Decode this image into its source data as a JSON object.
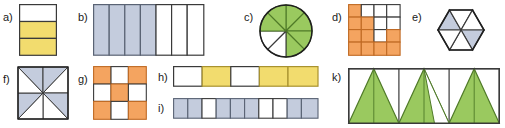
{
  "page": {
    "kind": "worksheet-fraction-shading-figures",
    "background": "#ffffff",
    "width": 505,
    "height": 128
  },
  "colors": {
    "yellow": "#f2dc6e",
    "yellow_stroke": "#a8922f",
    "blue": "#c4ccdd",
    "blue_stroke": "#5a6374",
    "orange": "#f0a köz",
    "orange_fill": "#f4a460",
    "orange_stroke": "#c06a24",
    "green": "#9ac95f",
    "green_stroke": "#4f7a28",
    "line": "#3a3a3a",
    "text": "#1a1a1a"
  },
  "labels": {
    "a": "a)",
    "b": "b)",
    "c": "c)",
    "d": "d)",
    "e": "e)",
    "f": "f)",
    "g": "g)",
    "h": "h)",
    "i": "i)",
    "k": "k)"
  },
  "figures": {
    "a": {
      "name": "vertical-thirds-rectangle",
      "type": "rows",
      "rows": 3,
      "fills": [
        "white",
        "yellow",
        "yellow"
      ],
      "shaded_count": 2,
      "total": 3,
      "fraction": "2/3"
    },
    "b": {
      "name": "seven-column-rectangle",
      "type": "columns",
      "columns": 7,
      "fills": [
        "blue",
        "blue",
        "blue",
        "blue",
        "white",
        "white",
        "white"
      ],
      "shaded_count": 4,
      "total": 7,
      "fraction": "4/7"
    },
    "c": {
      "name": "eight-sector-circle",
      "type": "pie",
      "sectors": 8,
      "fills": [
        "green",
        "green",
        "green",
        "green",
        "white",
        "white",
        "white",
        "green"
      ],
      "shaded_count": 5,
      "total": 8,
      "fraction": "5/8"
    },
    "d": {
      "name": "four-by-four-grid",
      "type": "grid",
      "rows": 4,
      "cols": 4,
      "cells": [
        [
          "orange",
          "white",
          "white",
          "white"
        ],
        [
          "orange",
          "orange",
          "white",
          "white"
        ],
        [
          "orange",
          "orange",
          "white",
          "orange"
        ],
        [
          "orange",
          "orange",
          "orange",
          "orange"
        ]
      ],
      "shaded_count": 10,
      "total": 16,
      "fraction": "10/16"
    },
    "e": {
      "name": "hexagon-six-triangles",
      "type": "hexagon",
      "sectors": 6,
      "fills": [
        "white",
        "white",
        "blue",
        "white",
        "white",
        "blue"
      ],
      "shaded_count": 2,
      "total": 6,
      "fraction": "2/6"
    },
    "f": {
      "name": "square-eight-triangles",
      "type": "square-pinwheel",
      "sectors": 8,
      "fills": [
        "blue",
        "blue",
        "white",
        "blue",
        "blue",
        "white",
        "blue",
        "blue"
      ],
      "shaded_count": 4,
      "total": 8,
      "fraction": "4/8"
    },
    "g": {
      "name": "three-by-three-checkerboard",
      "type": "grid",
      "rows": 3,
      "cols": 3,
      "cells": [
        [
          "orange",
          "white",
          "orange"
        ],
        [
          "white",
          "orange",
          "white"
        ],
        [
          "orange",
          "white",
          "orange"
        ]
      ],
      "shaded_count": 5,
      "total": 9,
      "fraction": "5/9"
    },
    "h": {
      "name": "five-cell-strip",
      "type": "columns",
      "columns": 5,
      "fills": [
        "white",
        "yellow",
        "white",
        "yellow",
        "yellow"
      ],
      "shaded_count": 3,
      "total": 5,
      "fraction": "3/5"
    },
    "i": {
      "name": "ten-cell-strip",
      "type": "columns",
      "columns": 10,
      "fills": [
        "blue",
        "blue",
        "white",
        "blue",
        "blue",
        "blue",
        "white",
        "white",
        "blue",
        "blue"
      ],
      "shaded_count": 7,
      "total": 10,
      "fraction": "7/10"
    },
    "k": {
      "name": "triangles-in-rectangle",
      "type": "triangles",
      "panels": 3,
      "triangles_per_panel": 2,
      "shaded_count": 5,
      "total": 6,
      "fraction": "5/6"
    }
  }
}
